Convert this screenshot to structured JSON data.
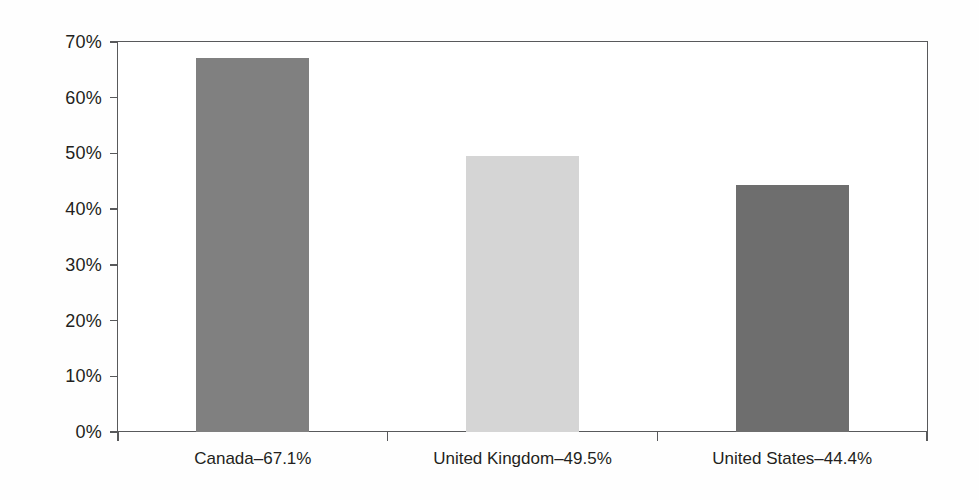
{
  "chart_data": {
    "type": "bar",
    "title": "",
    "subtitle": "",
    "xlabel": "",
    "ylabel": "",
    "grid": false,
    "legend": "none",
    "ylim": [
      0,
      70
    ],
    "ytick_labels": [
      "70%",
      "60%",
      "50%",
      "40%",
      "30%",
      "20%",
      "10%",
      "0%"
    ],
    "ytick_values": [
      70,
      60,
      50,
      40,
      30,
      20,
      10,
      0
    ],
    "categories": [
      "Canada",
      "United Kingdom",
      "United States"
    ],
    "tick_labels": [
      "Canada–67.1%",
      "United Kingdom–49.5%",
      "United States–44.4%"
    ],
    "values": [
      67.1,
      49.5,
      44.4
    ],
    "value_labels": [
      "67.1%",
      "49.5%",
      "44.4%"
    ],
    "bar_colors": [
      "#808080",
      "#d5d5d5",
      "#6e6e6e"
    ],
    "axis_color": "#58595b",
    "background_color": "#ffffff"
  }
}
